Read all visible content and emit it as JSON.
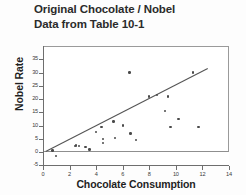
{
  "title": {
    "line1": "Original Chocolate / Nobel",
    "line2": "Data from Table 10-1"
  },
  "chart_data": {
    "type": "scatter",
    "title": "Original Chocolate / Nobel Data from Table 10-1",
    "xlabel": "Chocolate Consumption",
    "ylabel": "Nobel Rate",
    "xlim": [
      0,
      14
    ],
    "ylim": [
      -5,
      35
    ],
    "xticks": [
      0,
      2,
      4,
      6,
      8,
      10,
      12,
      14
    ],
    "yticks": [
      -5,
      0,
      5,
      10,
      15,
      20,
      25,
      30,
      35
    ],
    "grid": false,
    "legend": null,
    "marker": "circle",
    "marker_color": "#4a4a4a",
    "line_color": "#555555",
    "frame_color": "#8f8f8f",
    "points": [
      {
        "x": 0.7,
        "y": 0.5
      },
      {
        "x": 1.0,
        "y": -1.5
      },
      {
        "x": 2.4,
        "y": 2.2
      },
      {
        "x": 2.5,
        "y": 2.5
      },
      {
        "x": 2.7,
        "y": 2.3
      },
      {
        "x": 3.2,
        "y": 1.8
      },
      {
        "x": 3.5,
        "y": 1.0
      },
      {
        "x": 4.0,
        "y": 7.5
      },
      {
        "x": 4.4,
        "y": 9.5
      },
      {
        "x": 4.5,
        "y": 5.0
      },
      {
        "x": 4.5,
        "y": 3.5
      },
      {
        "x": 5.3,
        "y": 11.5
      },
      {
        "x": 5.4,
        "y": 5.2
      },
      {
        "x": 6.0,
        "y": 10.0
      },
      {
        "x": 6.5,
        "y": 30.0
      },
      {
        "x": 6.6,
        "y": 7.0
      },
      {
        "x": 7.0,
        "y": 4.5
      },
      {
        "x": 8.0,
        "y": 21.0
      },
      {
        "x": 8.6,
        "y": 21.5
      },
      {
        "x": 9.2,
        "y": 15.5
      },
      {
        "x": 9.4,
        "y": 21.0
      },
      {
        "x": 9.6,
        "y": 9.5
      },
      {
        "x": 10.2,
        "y": 12.5
      },
      {
        "x": 11.3,
        "y": 30.0
      },
      {
        "x": 11.7,
        "y": 9.5
      }
    ],
    "regression_line": {
      "x_start": 0.2,
      "y_start": 0.2,
      "x_end": 12.4,
      "y_end": 31.5
    }
  }
}
